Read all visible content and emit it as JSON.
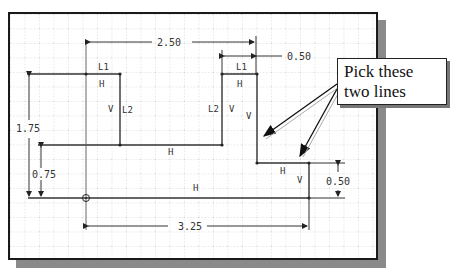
{
  "figure": {
    "grid_spacing_px": 14.5,
    "colors": {
      "frame": "#1a1a1a",
      "shadow": "#8a8a8a",
      "grid": "#b8b8b8",
      "geometry": "#333333",
      "text": "#333333"
    }
  },
  "dimensions": [
    {
      "id": "dim-top-width",
      "label": "2.50"
    },
    {
      "id": "dim-top-right-width",
      "label": "0.50"
    },
    {
      "id": "dim-left-height-total",
      "label": "1.75"
    },
    {
      "id": "dim-left-height-lower",
      "label": "0.75"
    },
    {
      "id": "dim-right-step-height",
      "label": "0.50"
    },
    {
      "id": "dim-bottom-width",
      "label": "3.25"
    }
  ],
  "constraints": {
    "L1_left": "L1",
    "L1_right": "L1",
    "L2_left": "L2",
    "L2_right": "L2",
    "h_top_left": "H",
    "h_top_right": "H",
    "h_middle": "H",
    "h_lower_right": "H",
    "h_bottom": "H",
    "v_left": "V",
    "v_right_a": "V",
    "v_right_b": "V",
    "v_step": "V"
  },
  "callout": {
    "text": "Pick these two lines"
  }
}
